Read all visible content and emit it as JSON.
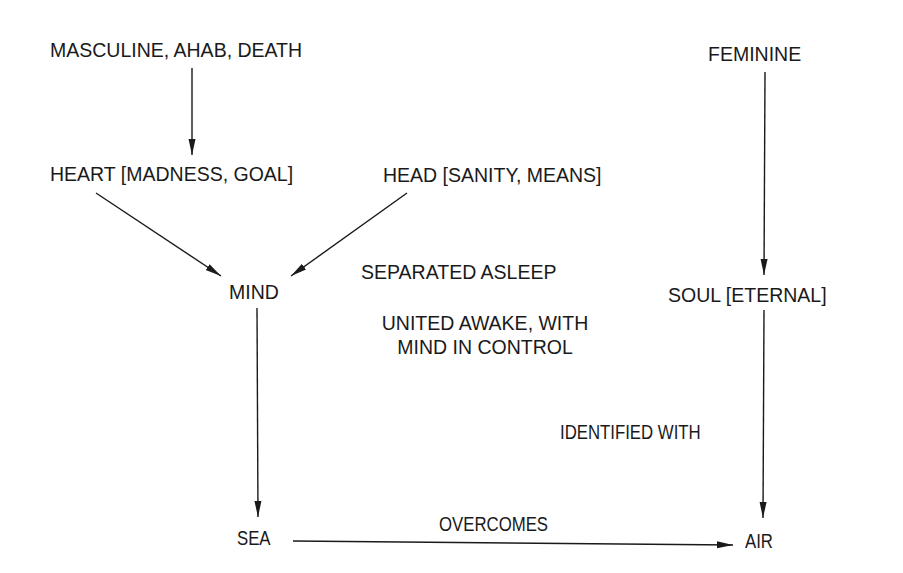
{
  "diagram": {
    "nodes": {
      "masculine": {
        "text": "MASCULINE, AHAB, DEATH"
      },
      "feminine": {
        "text": "FEMININE"
      },
      "heart": {
        "text": "HEART [MADNESS, GOAL]"
      },
      "head": {
        "text": "HEAD [SANITY, MEANS]"
      },
      "mind": {
        "text": "MIND"
      },
      "soul": {
        "text": "SOUL [ETERNAL]"
      },
      "sea": {
        "text": "SEA"
      },
      "air": {
        "text": "AIR"
      }
    },
    "annotations": {
      "separated": {
        "text": "SEPARATED ASLEEP"
      },
      "united_line1": {
        "text": "UNITED AWAKE, WITH"
      },
      "united_line2": {
        "text": "MIND IN CONTROL"
      }
    },
    "edges": [
      {
        "from": "masculine",
        "to": "heart",
        "label": ""
      },
      {
        "from": "heart",
        "to": "mind",
        "label": ""
      },
      {
        "from": "head",
        "to": "mind",
        "label": ""
      },
      {
        "from": "mind",
        "to": "sea",
        "label": ""
      },
      {
        "from": "feminine",
        "to": "soul",
        "label": ""
      },
      {
        "from": "soul",
        "to": "air",
        "label": "IDENTIFIED WITH"
      },
      {
        "from": "sea",
        "to": "air",
        "label": "OVERCOMES"
      }
    ],
    "edge_labels": {
      "identified_with": "IDENTIFIED WITH",
      "overcomes": "OVERCOMES"
    },
    "colors": {
      "ink": "#1a1a1a",
      "background": "#ffffff"
    }
  }
}
